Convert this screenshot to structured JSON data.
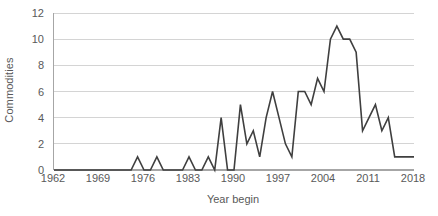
{
  "chart_data": {
    "type": "line",
    "title": "",
    "xlabel": "Year begin",
    "ylabel": "Commodities",
    "xlim": [
      1962,
      2018
    ],
    "ylim": [
      0,
      12
    ],
    "grid": true,
    "legend": false,
    "y_ticks": [
      0,
      2,
      4,
      6,
      8,
      10,
      12
    ],
    "y_tick_labels": [
      "0",
      "2",
      "4",
      "6",
      "8",
      "10",
      "12"
    ],
    "x_ticks": [
      1962,
      1969,
      1976,
      1983,
      1990,
      1997,
      2004,
      2011,
      2018
    ],
    "x_tick_labels": [
      "1962",
      "1969",
      "1976",
      "1983",
      "1990",
      "1997",
      "2004",
      "2011",
      "2018"
    ],
    "line_color": "#3f3f3f",
    "grid_color": "#d4d4d4",
    "axis_color": "#a6a6a6",
    "background": "#ffffff",
    "text_color": "#595959",
    "x": [
      1962,
      1963,
      1964,
      1965,
      1966,
      1967,
      1968,
      1969,
      1970,
      1971,
      1972,
      1973,
      1974,
      1975,
      1976,
      1977,
      1978,
      1979,
      1980,
      1981,
      1982,
      1983,
      1984,
      1985,
      1986,
      1987,
      1988,
      1989,
      1990,
      1991,
      1992,
      1993,
      1994,
      1995,
      1996,
      1997,
      1998,
      1999,
      2000,
      2001,
      2002,
      2003,
      2004,
      2005,
      2006,
      2007,
      2008,
      2009,
      2010,
      2011,
      2012,
      2013,
      2014,
      2015,
      2016,
      2017,
      2018
    ],
    "values": [
      0,
      0,
      0,
      0,
      0,
      0,
      0,
      0,
      0,
      0,
      0,
      0,
      0,
      1,
      0,
      0,
      1,
      0,
      0,
      0,
      0,
      1,
      0,
      0,
      1,
      0,
      4,
      0,
      0,
      5,
      2,
      3,
      1,
      4,
      6,
      4,
      2,
      1,
      6,
      6,
      5,
      7,
      6,
      10,
      11,
      10,
      10,
      9,
      3,
      4,
      5,
      3,
      4,
      1,
      1,
      1,
      1
    ],
    "series_name": "Commodities"
  }
}
